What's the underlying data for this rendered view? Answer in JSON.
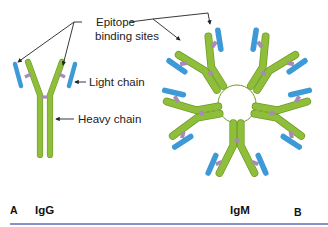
{
  "figure": {
    "labels": {
      "epitope_line1": "Epitope",
      "epitope_line2": "binding sites",
      "light_chain": "Light chain",
      "heavy_chain": "Heavy chain"
    },
    "panels": {
      "a_letter": "A",
      "a_title": "IgG",
      "b_title": "IgM",
      "b_letter": "B"
    },
    "colors": {
      "heavy_chain": "#8fbf3a",
      "light_chain": "#3d9ad6",
      "disulfide_bond": "#a88ab8",
      "divider": "#8a8fc8"
    }
  }
}
